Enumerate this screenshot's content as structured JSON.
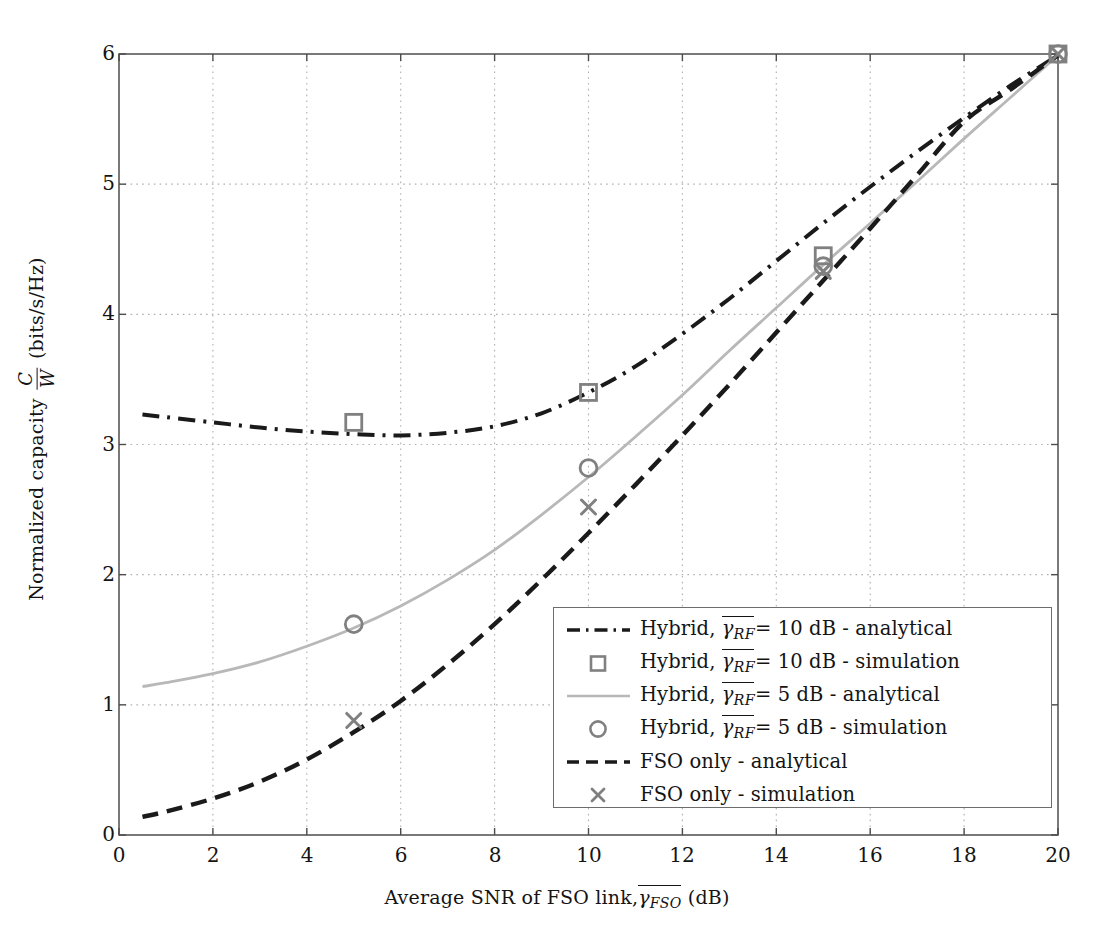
{
  "chart_data": {
    "type": "line",
    "title": "",
    "xlabel": "Average SNR of FSO link, γ̄_FSO (dB)",
    "ylabel": "Normalized capacity C/W (bits/s/Hz)",
    "xlim": [
      0,
      20
    ],
    "ylim": [
      0,
      6
    ],
    "xticks": [
      0,
      2,
      4,
      6,
      8,
      10,
      12,
      14,
      16,
      18,
      20
    ],
    "yticks": [
      0,
      1,
      2,
      3,
      4,
      5,
      6
    ],
    "grid": true,
    "grid_style": "dotted",
    "legend_position": "lower right",
    "series": [
      {
        "name": "Hybrid, γ̄_RF = 10 dB - analytical",
        "kind": "line",
        "style": "dash-dot",
        "color": "#1a1a1a",
        "x": [
          0.5,
          1,
          2,
          3,
          4,
          5,
          6,
          7,
          8,
          9,
          10,
          11,
          12,
          13,
          14,
          15,
          16,
          17,
          18,
          19,
          20
        ],
        "y": [
          3.23,
          3.21,
          3.17,
          3.13,
          3.1,
          3.08,
          3.07,
          3.09,
          3.14,
          3.24,
          3.4,
          3.6,
          3.85,
          4.12,
          4.41,
          4.7,
          4.98,
          5.25,
          5.51,
          5.76,
          5.99
        ]
      },
      {
        "name": "Hybrid, γ̄_RF = 10 dB - simulation",
        "kind": "marker",
        "marker": "square",
        "color": "#808080",
        "x": [
          5,
          10,
          15,
          20
        ],
        "y": [
          3.17,
          3.4,
          4.45,
          6.0
        ]
      },
      {
        "name": "Hybrid, γ̄_RF = 5 dB - analytical",
        "kind": "line",
        "style": "solid",
        "color": "#b8b8b8",
        "x": [
          0.5,
          1,
          2,
          3,
          4,
          5,
          6,
          7,
          8,
          9,
          10,
          11,
          12,
          13,
          14,
          15,
          16,
          17,
          18,
          19,
          20
        ],
        "y": [
          1.14,
          1.17,
          1.24,
          1.33,
          1.45,
          1.59,
          1.76,
          1.96,
          2.19,
          2.46,
          2.75,
          3.06,
          3.38,
          3.72,
          4.05,
          4.38,
          4.7,
          5.02,
          5.35,
          5.67,
          5.99
        ]
      },
      {
        "name": "Hybrid, γ̄_RF = 5 dB - simulation",
        "kind": "marker",
        "marker": "circle",
        "color": "#808080",
        "x": [
          5,
          10,
          15,
          20
        ],
        "y": [
          1.62,
          2.82,
          4.37,
          6.0
        ]
      },
      {
        "name": "FSO only - analytical",
        "kind": "line",
        "style": "dashed",
        "color": "#1a1a1a",
        "x": [
          0.5,
          1,
          2,
          3,
          4,
          5,
          6,
          7,
          8,
          9,
          10,
          11,
          12,
          13,
          14,
          15,
          16,
          17,
          18,
          19,
          20
        ],
        "y": [
          0.14,
          0.18,
          0.28,
          0.41,
          0.58,
          0.79,
          1.03,
          1.31,
          1.62,
          1.96,
          2.32,
          2.69,
          3.07,
          3.46,
          3.86,
          4.26,
          4.66,
          5.07,
          5.48,
          5.73,
          5.99
        ]
      },
      {
        "name": "FSO only - simulation",
        "kind": "marker",
        "marker": "cross",
        "color": "#808080",
        "x": [
          5,
          10,
          15,
          20
        ],
        "y": [
          0.88,
          2.52,
          4.33,
          6.0
        ]
      }
    ]
  },
  "axes": {
    "x_title_prefix": "Average SNR of FSO link,",
    "x_title_gamma": "γ",
    "x_title_sub": "FSO",
    "x_title_unit": "(dB)",
    "y_title_prefix": "Normalized capacity",
    "y_frac_num": "C",
    "y_frac_den": "W",
    "y_title_unit": "(bits/s/Hz)",
    "xticks": [
      "0",
      "2",
      "4",
      "6",
      "8",
      "10",
      "12",
      "14",
      "16",
      "18",
      "20"
    ],
    "yticks": [
      "0",
      "1",
      "2",
      "3",
      "4",
      "5",
      "6"
    ]
  },
  "legend": {
    "entries": [
      {
        "marker": "dash-dot-line",
        "prefix": "Hybrid,",
        "gamma": "γ",
        "sub": "RF",
        "eq": "= 10 dB - analytical"
      },
      {
        "marker": "square",
        "prefix": "Hybrid,",
        "gamma": "γ",
        "sub": "RF",
        "eq": "= 10 dB - simulation"
      },
      {
        "marker": "solid-gray-line",
        "prefix": "Hybrid,",
        "gamma": "γ",
        "sub": "RF",
        "eq": "= 5 dB - analytical"
      },
      {
        "marker": "circle",
        "prefix": "Hybrid,",
        "gamma": "γ",
        "sub": "RF",
        "eq": "= 5 dB - simulation"
      },
      {
        "marker": "dashed-line",
        "prefix": "FSO only - analytical",
        "gamma": "",
        "sub": "",
        "eq": ""
      },
      {
        "marker": "cross",
        "prefix": "FSO only - simulation",
        "gamma": "",
        "sub": "",
        "eq": ""
      }
    ]
  },
  "colors": {
    "axis": "#4d4d4d",
    "grid": "#b0b0b0",
    "dark_curve": "#1a1a1a",
    "light_curve": "#b8b8b8",
    "marker": "#808080",
    "legend_border": "#6d6d6d"
  }
}
